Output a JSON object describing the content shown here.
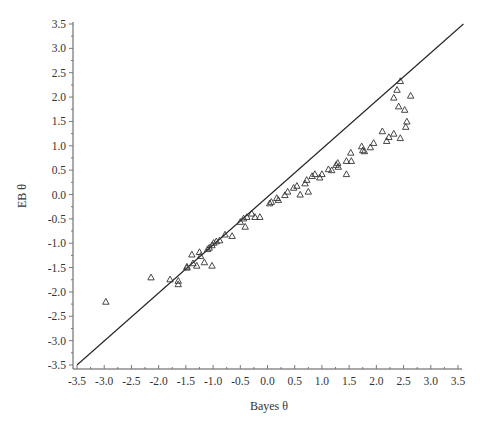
{
  "chart_data": {
    "type": "scatter",
    "title": "",
    "xlabel": "Bayes θ",
    "ylabel": "EB θ",
    "xlim": [
      -3.5,
      3.5
    ],
    "ylim": [
      -3.5,
      3.5
    ],
    "grid": false,
    "legend": null,
    "x_ticks": [
      "-3.5",
      "-3.0",
      "-2.5",
      "-2.0",
      "-1.5",
      "-1.0",
      "-0.5",
      "0.0",
      "0.5",
      "1.0",
      "1.5",
      "2.0",
      "2.5",
      "3.0",
      "3.5"
    ],
    "y_ticks": [
      "3.5",
      "3.0",
      "2.5",
      "2.0",
      "1.5",
      "1.0",
      "0.5",
      "0.0",
      "-0.5",
      "-1.0",
      "-1.5",
      "-2.0",
      "-2.5",
      "-3.0",
      "-3.5"
    ],
    "reference_line": {
      "label": "identity line y = x",
      "from": [
        -3.5,
        -3.5
      ],
      "to": [
        3.6,
        3.5
      ]
    },
    "marker": "triangle-open",
    "series": [
      {
        "name": "θ estimates",
        "points": [
          [
            -2.97,
            -2.2
          ],
          [
            -2.14,
            -1.7
          ],
          [
            -1.79,
            -1.74
          ],
          [
            -1.64,
            -1.77
          ],
          [
            -1.64,
            -1.84
          ],
          [
            -1.48,
            -1.48
          ],
          [
            -1.48,
            -1.5
          ],
          [
            -1.39,
            -1.23
          ],
          [
            -1.37,
            -1.41
          ],
          [
            -1.3,
            -1.46
          ],
          [
            -1.25,
            -1.18
          ],
          [
            -1.23,
            -1.26
          ],
          [
            -1.16,
            -1.39
          ],
          [
            -1.1,
            -1.12
          ],
          [
            -1.07,
            -1.09
          ],
          [
            -1.02,
            -1.04
          ],
          [
            -1.02,
            -1.46
          ],
          [
            -0.99,
            -0.99
          ],
          [
            -0.94,
            -0.96
          ],
          [
            -0.88,
            -0.94
          ],
          [
            -0.78,
            -0.82
          ],
          [
            -0.65,
            -0.85
          ],
          [
            -0.5,
            -0.56
          ],
          [
            -0.44,
            -0.49
          ],
          [
            -0.41,
            -0.66
          ],
          [
            -0.38,
            -0.46
          ],
          [
            -0.29,
            -0.39
          ],
          [
            -0.23,
            -0.46
          ],
          [
            -0.14,
            -0.46
          ],
          [
            0.04,
            -0.18
          ],
          [
            0.07,
            -0.15
          ],
          [
            0.17,
            -0.07
          ],
          [
            0.2,
            -0.11
          ],
          [
            0.32,
            -0.01
          ],
          [
            0.37,
            0.06
          ],
          [
            0.48,
            0.14
          ],
          [
            0.54,
            0.18
          ],
          [
            0.6,
            0.0
          ],
          [
            0.69,
            0.23
          ],
          [
            0.72,
            0.3
          ],
          [
            0.75,
            0.06
          ],
          [
            0.82,
            0.38
          ],
          [
            0.87,
            0.42
          ],
          [
            0.96,
            0.35
          ],
          [
            1.0,
            0.42
          ],
          [
            1.12,
            0.52
          ],
          [
            1.18,
            0.5
          ],
          [
            1.26,
            0.61
          ],
          [
            1.29,
            0.65
          ],
          [
            1.3,
            0.57
          ],
          [
            1.45,
            0.69
          ],
          [
            1.45,
            0.42
          ],
          [
            1.54,
            0.69
          ],
          [
            1.53,
            0.86
          ],
          [
            1.73,
            0.99
          ],
          [
            1.75,
            0.91
          ],
          [
            1.78,
            0.89
          ],
          [
            1.89,
            0.97
          ],
          [
            1.95,
            1.06
          ],
          [
            2.11,
            1.3
          ],
          [
            2.19,
            1.1
          ],
          [
            2.23,
            1.18
          ],
          [
            2.32,
            1.25
          ],
          [
            2.44,
            1.16
          ],
          [
            2.54,
            1.39
          ],
          [
            2.56,
            1.5
          ],
          [
            2.52,
            1.74
          ],
          [
            2.41,
            1.81
          ],
          [
            2.32,
            1.99
          ],
          [
            2.38,
            2.15
          ],
          [
            2.44,
            2.33
          ],
          [
            2.63,
            2.03
          ]
        ]
      }
    ]
  },
  "layout": {
    "x_axis_px": {
      "min_value_px": 77,
      "max_value_px": 458,
      "axis_y_px": 369,
      "line_start_px": 73,
      "line_end_px": 462
    },
    "y_axis_px": {
      "max_value_px": 24,
      "min_value_px": 365,
      "axis_x_px": 73,
      "line_start_px": 22,
      "line_end_px": 369
    }
  }
}
